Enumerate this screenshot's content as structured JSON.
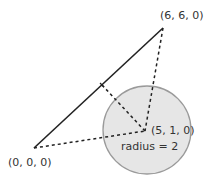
{
  "diagram": {
    "points": {
      "origin": {
        "label": "(0, 0, 0)"
      },
      "end": {
        "label": "(6, 6, 0)"
      },
      "center": {
        "label": "(5, 1, 0)"
      }
    },
    "circle": {
      "radius_label": "radius = 2",
      "fill": "#e6e6e6",
      "stroke": "#999999"
    },
    "segment": {
      "color": "#222222"
    },
    "dashed_lines": [
      "origin-to-center",
      "end-to-center",
      "perpendicular-foot-to-center"
    ]
  }
}
